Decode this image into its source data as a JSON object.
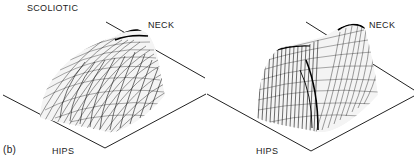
{
  "figure": {
    "condition_label": "SCOLIOTIC",
    "panel_label": "(b)",
    "plots": [
      {
        "neck_label": "NECK",
        "hips_label": "HIPS"
      },
      {
        "neck_label": "NECK",
        "hips_label": "HIPS"
      }
    ],
    "colors": {
      "ink": "#1a1a1a",
      "background": "#ffffff"
    }
  }
}
